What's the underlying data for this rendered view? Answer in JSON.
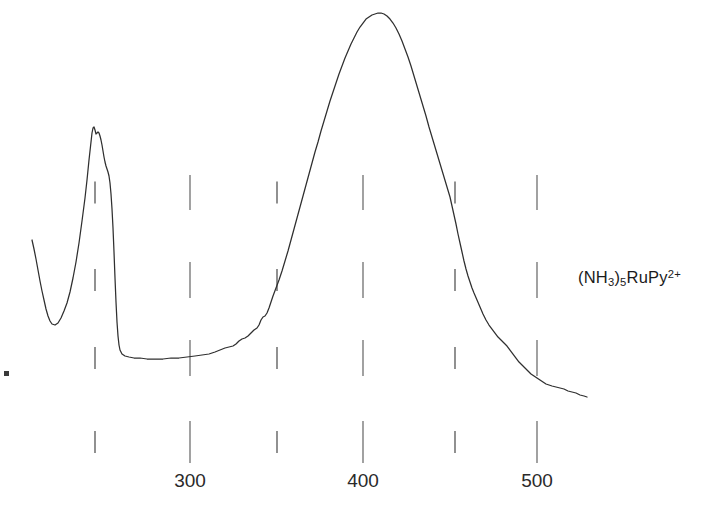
{
  "figure": {
    "background_color": "#ffffff",
    "curve_color": "#2f2f2f",
    "tick_color": "#555555",
    "width": 710,
    "height": 521
  },
  "annotation": {
    "species_label_plain": "(NH3)5RuPy2+",
    "parts": {
      "open_paren": "(NH",
      "sub_3": "3",
      "close_paren_sub": ")",
      "sub_5": "5",
      "rupy": "RuPy",
      "charge": "2+"
    }
  },
  "marker": {
    "name": "corner-dot",
    "x": 4,
    "y": 371
  },
  "chart_data": {
    "type": "line",
    "title": "",
    "subtitle": "",
    "xlabel": "",
    "ylabel": "",
    "legend": [
      "(NH3)5RuPy2+"
    ],
    "legend_position": "right-inside",
    "grid": false,
    "axis_style": "floating-tick-marks",
    "xlim": [
      233,
      556
    ],
    "ylim": [
      0,
      1
    ],
    "x_tick_labels": [
      "300",
      "400",
      "500"
    ],
    "x_tick_values": [
      300,
      400,
      500
    ],
    "x_major_ticks_px": [
      190,
      363,
      537
    ],
    "x_minor_ticks_px": [
      95,
      277,
      455
    ],
    "tick_rows_y": [
      {
        "name": "row-top",
        "y_start": 175,
        "long": 35,
        "short": 22
      },
      {
        "name": "row-upper-mid",
        "y_start": 262,
        "long": 36,
        "short": 22
      },
      {
        "name": "row-lower-mid",
        "y_start": 340,
        "long": 36,
        "short": 22
      },
      {
        "name": "row-bottom",
        "y_start": 421,
        "long": 42,
        "short": 22
      }
    ],
    "annotations": [
      {
        "text": "(NH3)5RuPy2+",
        "x": 578,
        "y": 269
      }
    ],
    "features": [
      {
        "name": "left-edge-shoulder",
        "wavelength_nm": 234,
        "absorbance": 0.56
      },
      {
        "name": "uv-minimum",
        "wavelength_nm": 245,
        "absorbance": 0.13
      },
      {
        "name": "uv-peak",
        "wavelength_nm": 268,
        "absorbance": 0.96
      },
      {
        "name": "baseline-plateau-start",
        "wavelength_nm": 280,
        "absorbance": 0.04
      },
      {
        "name": "baseline-plateau-end",
        "wavelength_nm": 320,
        "absorbance": 0.04
      },
      {
        "name": "mlct-peak",
        "wavelength_nm": 412,
        "absorbance": 1.0
      },
      {
        "name": "tail-end",
        "wavelength_nm": 552,
        "absorbance": 0.0
      }
    ],
    "series": [
      {
        "name": "(NH3)5RuPy2+ absorption spectrum",
        "points_px": [
          [
            32,
            240
          ],
          [
            34,
            249
          ],
          [
            36,
            259
          ],
          [
            38,
            270
          ],
          [
            40,
            281
          ],
          [
            42,
            291
          ],
          [
            44,
            300
          ],
          [
            46,
            309
          ],
          [
            48,
            316
          ],
          [
            50,
            321
          ],
          [
            52,
            324
          ],
          [
            55,
            325
          ],
          [
            58,
            323
          ],
          [
            61,
            318
          ],
          [
            64,
            311
          ],
          [
            67,
            303
          ],
          [
            70,
            292
          ],
          [
            73,
            278
          ],
          [
            76,
            262
          ],
          [
            79,
            243
          ],
          [
            82,
            221
          ],
          [
            85,
            198
          ],
          [
            87,
            180
          ],
          [
            89,
            160
          ],
          [
            91,
            142
          ],
          [
            92,
            133
          ],
          [
            93,
            128
          ],
          [
            94,
            127
          ],
          [
            95,
            130
          ],
          [
            96,
            134
          ],
          [
            97,
            133
          ],
          [
            98,
            132
          ],
          [
            99,
            133
          ],
          [
            100,
            136
          ],
          [
            101,
            140
          ],
          [
            102,
            145
          ],
          [
            103,
            151
          ],
          [
            104,
            157
          ],
          [
            105,
            162
          ],
          [
            106,
            166
          ],
          [
            107,
            169
          ],
          [
            108,
            172
          ],
          [
            109,
            176
          ],
          [
            110,
            183
          ],
          [
            111,
            194
          ],
          [
            112,
            209
          ],
          [
            113,
            228
          ],
          [
            114,
            252
          ],
          [
            115,
            278
          ],
          [
            116,
            302
          ],
          [
            117,
            322
          ],
          [
            118,
            336
          ],
          [
            119,
            345
          ],
          [
            120,
            350
          ],
          [
            122,
            354
          ],
          [
            125,
            356
          ],
          [
            129,
            357
          ],
          [
            134,
            358
          ],
          [
            140,
            358
          ],
          [
            147,
            359
          ],
          [
            155,
            359
          ],
          [
            163,
            359
          ],
          [
            171,
            358
          ],
          [
            179,
            358
          ],
          [
            187,
            357
          ],
          [
            195,
            356
          ],
          [
            202,
            355
          ],
          [
            209,
            354
          ],
          [
            215,
            352
          ],
          [
            220,
            350
          ],
          [
            225,
            348
          ],
          [
            229,
            347
          ],
          [
            233,
            346
          ],
          [
            236,
            344
          ],
          [
            239,
            341
          ],
          [
            242,
            339
          ],
          [
            245,
            338
          ],
          [
            248,
            336
          ],
          [
            251,
            333
          ],
          [
            254,
            330
          ],
          [
            257,
            328
          ],
          [
            259,
            325
          ],
          [
            261,
            320
          ],
          [
            263,
            317
          ],
          [
            265,
            316
          ],
          [
            267,
            313
          ],
          [
            269,
            308
          ],
          [
            271,
            302
          ],
          [
            273,
            296
          ],
          [
            276,
            288
          ],
          [
            279,
            280
          ],
          [
            282,
            271
          ],
          [
            285,
            261
          ],
          [
            288,
            251
          ],
          [
            291,
            240
          ],
          [
            294,
            229
          ],
          [
            297,
            218
          ],
          [
            300,
            207
          ],
          [
            303,
            196
          ],
          [
            306,
            185
          ],
          [
            309,
            174
          ],
          [
            312,
            163
          ],
          [
            315,
            152
          ],
          [
            318,
            142
          ],
          [
            321,
            131
          ],
          [
            324,
            121
          ],
          [
            327,
            111
          ],
          [
            330,
            101
          ],
          [
            333,
            92
          ],
          [
            336,
            83
          ],
          [
            339,
            74
          ],
          [
            342,
            66
          ],
          [
            345,
            58
          ],
          [
            348,
            51
          ],
          [
            351,
            44
          ],
          [
            354,
            38
          ],
          [
            357,
            32
          ],
          [
            360,
            27
          ],
          [
            363,
            23
          ],
          [
            366,
            19
          ],
          [
            369,
            17
          ],
          [
            372,
            15
          ],
          [
            375,
            14
          ],
          [
            378,
            13
          ],
          [
            381,
            13
          ],
          [
            384,
            14
          ],
          [
            387,
            16
          ],
          [
            390,
            19
          ],
          [
            393,
            23
          ],
          [
            396,
            28
          ],
          [
            399,
            34
          ],
          [
            402,
            41
          ],
          [
            405,
            49
          ],
          [
            408,
            57
          ],
          [
            411,
            66
          ],
          [
            414,
            76
          ],
          [
            417,
            86
          ],
          [
            420,
            96
          ],
          [
            423,
            106
          ],
          [
            426,
            116
          ],
          [
            429,
            127
          ],
          [
            432,
            137
          ],
          [
            435,
            147
          ],
          [
            438,
            157
          ],
          [
            441,
            167
          ],
          [
            444,
            177
          ],
          [
            447,
            187
          ],
          [
            450,
            197
          ],
          [
            452,
            206
          ],
          [
            454,
            215
          ],
          [
            456,
            224
          ],
          [
            458,
            234
          ],
          [
            460,
            243
          ],
          [
            462,
            252
          ],
          [
            464,
            261
          ],
          [
            466,
            269
          ],
          [
            468,
            276
          ],
          [
            470,
            282
          ],
          [
            472,
            288
          ],
          [
            474,
            293
          ],
          [
            477,
            300
          ],
          [
            480,
            307
          ],
          [
            483,
            314
          ],
          [
            486,
            320
          ],
          [
            489,
            325
          ],
          [
            492,
            329
          ],
          [
            495,
            333
          ],
          [
            498,
            337
          ],
          [
            501,
            340
          ],
          [
            504,
            343
          ],
          [
            507,
            346
          ],
          [
            510,
            350
          ],
          [
            513,
            354
          ],
          [
            516,
            358
          ],
          [
            519,
            362
          ],
          [
            522,
            365
          ],
          [
            525,
            368
          ],
          [
            528,
            371
          ],
          [
            531,
            374
          ],
          [
            534,
            376
          ],
          [
            537,
            378
          ],
          [
            540,
            380
          ],
          [
            543,
            382
          ],
          [
            546,
            384
          ],
          [
            549,
            385
          ],
          [
            552,
            386
          ],
          [
            556,
            387
          ],
          [
            560,
            388
          ],
          [
            564,
            389
          ],
          [
            568,
            391
          ],
          [
            572,
            392
          ],
          [
            576,
            393
          ],
          [
            580,
            395
          ],
          [
            584,
            396
          ],
          [
            587,
            397
          ]
        ]
      }
    ]
  }
}
